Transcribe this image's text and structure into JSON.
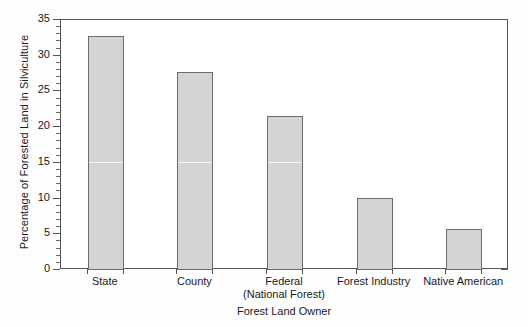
{
  "chart_data": {
    "type": "bar",
    "title": "",
    "xlabel": "Forest Land Owner",
    "ylabel": "Percentage of Forested Land in Silviculture",
    "categories": [
      "State",
      "County",
      "Federal\n(National Forest)",
      "Forest Industry",
      "Native American"
    ],
    "category_lines": [
      [
        "State"
      ],
      [
        "County"
      ],
      [
        "Federal",
        "(National Forest)"
      ],
      [
        "Forest Industry"
      ],
      [
        "Native American"
      ]
    ],
    "values": [
      32.7,
      27.7,
      21.5,
      10.1,
      5.7
    ],
    "ylim": [
      0,
      35
    ],
    "yticks": [
      0,
      5,
      10,
      15,
      20,
      25,
      30,
      35
    ],
    "ytick_labels": [
      "0",
      "5",
      "10",
      "15",
      "20",
      "25",
      "30",
      "35"
    ],
    "y_minor_tick_step": 1,
    "grid": false,
    "legend": null,
    "bar_fill_color": "#d4d4d4",
    "bar_edge_color": "#6d6d6d",
    "axis_color": "#555555",
    "background_color": "#ffffff"
  }
}
